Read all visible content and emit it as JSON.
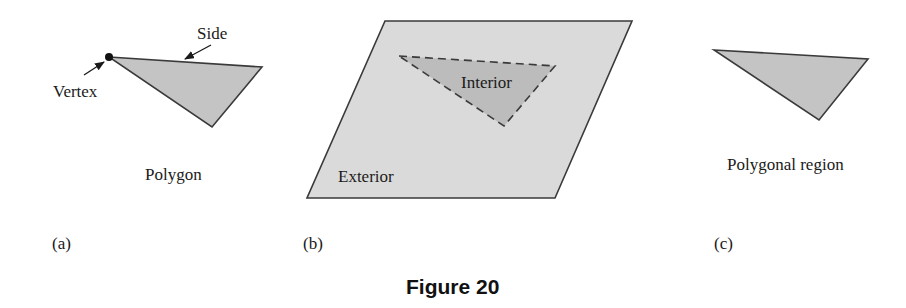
{
  "figure": {
    "caption": "Figure 20",
    "colors": {
      "background": "#ffffff",
      "edge": "#3a3a3a",
      "polygon_fill": "#c4c4c4",
      "plane_fill": "#dadada",
      "interior_fill": "#bcbcbc",
      "text": "#1a1a1a"
    },
    "panels": [
      {
        "tag": "(a)",
        "caption": "Polygon",
        "annotations": {
          "vertex": "Vertex",
          "side": "Side"
        }
      },
      {
        "tag": "(b)",
        "annotations": {
          "interior": "Interior",
          "exterior": "Exterior"
        }
      },
      {
        "tag": "(c)",
        "caption": "Polygonal region"
      }
    ]
  }
}
